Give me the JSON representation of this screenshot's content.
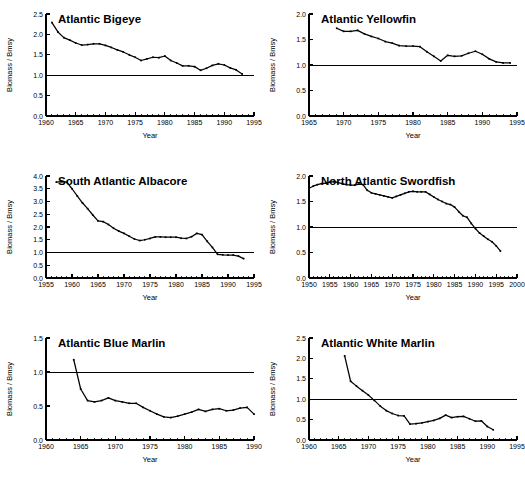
{
  "figure": {
    "shared_xlabel": "Year",
    "shared_ylabel": "Biomass / Bmsy",
    "line_color": "#000000",
    "reference_line_value": 1.0
  },
  "chart_data": [
    {
      "type": "line",
      "title": "Atlantic Bigeye",
      "xlabel": "Year",
      "ylabel": "Biomass / Bmsy",
      "xlim": [
        1960,
        1995
      ],
      "ylim": [
        0.0,
        2.5
      ],
      "xticks": [
        1960,
        1965,
        1970,
        1975,
        1980,
        1985,
        1990,
        1995
      ],
      "yticks": [
        0.0,
        0.5,
        1.0,
        1.5,
        2.0,
        2.5
      ],
      "xtick_labels": [
        "1960",
        "1965",
        "1970",
        "1975",
        "1980",
        "1985",
        "1990",
        "1995"
      ],
      "ytick_labels": [
        "0.0",
        "0.5",
        "1.0",
        "1.5",
        "2.0",
        "2.5"
      ],
      "minor_tick_step": 1,
      "grid": false,
      "reference_line": 1.0,
      "x": [
        1961,
        1962,
        1963,
        1964,
        1965,
        1966,
        1967,
        1968,
        1969,
        1970,
        1971,
        1972,
        1973,
        1974,
        1975,
        1976,
        1977,
        1978,
        1979,
        1980,
        1981,
        1982,
        1983,
        1984,
        1985,
        1986,
        1987,
        1988,
        1989,
        1990,
        1991,
        1992,
        1993
      ],
      "values": [
        2.29,
        2.06,
        1.92,
        1.86,
        1.79,
        1.74,
        1.75,
        1.77,
        1.77,
        1.73,
        1.68,
        1.62,
        1.57,
        1.5,
        1.44,
        1.36,
        1.4,
        1.44,
        1.43,
        1.47,
        1.36,
        1.3,
        1.23,
        1.23,
        1.21,
        1.12,
        1.17,
        1.24,
        1.28,
        1.25,
        1.18,
        1.13,
        1.03
      ]
    },
    {
      "type": "line",
      "title": "Atlantic Yellowfin",
      "xlabel": "Year",
      "ylabel": "Biomass / Bmsy",
      "xlim": [
        1965,
        1995
      ],
      "ylim": [
        0.0,
        2.0
      ],
      "xticks": [
        1965,
        1970,
        1975,
        1980,
        1985,
        1990,
        1995
      ],
      "yticks": [
        0.0,
        0.5,
        1.0,
        1.5,
        2.0
      ],
      "xtick_labels": [
        "1965",
        "1970",
        "1975",
        "1980",
        "1985",
        "1990",
        "1995"
      ],
      "ytick_labels": [
        "0.0",
        "0.5",
        "1.0",
        "1.5",
        "2.0"
      ],
      "minor_tick_step": 1,
      "grid": false,
      "reference_line": 1.0,
      "x": [
        1969,
        1970,
        1971,
        1972,
        1973,
        1974,
        1975,
        1976,
        1977,
        1978,
        1979,
        1980,
        1981,
        1982,
        1983,
        1984,
        1985,
        1986,
        1987,
        1988,
        1989,
        1990,
        1991,
        1992,
        1993,
        1994
      ],
      "values": [
        1.72,
        1.66,
        1.66,
        1.68,
        1.61,
        1.56,
        1.52,
        1.46,
        1.43,
        1.38,
        1.37,
        1.37,
        1.36,
        1.26,
        1.17,
        1.08,
        1.19,
        1.17,
        1.18,
        1.23,
        1.27,
        1.21,
        1.12,
        1.06,
        1.04,
        1.04
      ]
    },
    {
      "type": "line",
      "title": "South Atlantic Albacore",
      "xlabel": "Year",
      "ylabel": "Biomass / Bmsy",
      "xlim": [
        1955,
        1995
      ],
      "ylim": [
        0.0,
        4.0
      ],
      "xticks": [
        1955,
        1960,
        1965,
        1970,
        1975,
        1980,
        1985,
        1990,
        1995
      ],
      "yticks": [
        0.0,
        0.5,
        1.0,
        1.5,
        2.0,
        2.5,
        3.0,
        3.5,
        4.0
      ],
      "xtick_labels": [
        "1955",
        "1960",
        "1965",
        "1970",
        "1975",
        "1980",
        "1985",
        "1990",
        "1995"
      ],
      "ytick_labels": [
        "0.0",
        "0.5",
        "1.0",
        "1.5",
        "2.0",
        "2.5",
        "3.0",
        "3.5",
        "4.0"
      ],
      "minor_tick_step": 1,
      "grid": false,
      "reference_line": 1.0,
      "x": [
        1957,
        1958,
        1959,
        1960,
        1961,
        1962,
        1963,
        1964,
        1965,
        1966,
        1967,
        1968,
        1969,
        1970,
        1971,
        1972,
        1973,
        1974,
        1975,
        1976,
        1977,
        1978,
        1979,
        1980,
        1981,
        1982,
        1983,
        1984,
        1985,
        1986,
        1987,
        1988,
        1989,
        1990,
        1991,
        1992,
        1993
      ],
      "values": [
        3.76,
        3.78,
        3.76,
        3.5,
        3.22,
        2.95,
        2.72,
        2.47,
        2.24,
        2.21,
        2.1,
        1.95,
        1.84,
        1.75,
        1.64,
        1.53,
        1.47,
        1.5,
        1.55,
        1.61,
        1.61,
        1.6,
        1.6,
        1.6,
        1.56,
        1.55,
        1.62,
        1.75,
        1.7,
        1.44,
        1.2,
        0.93,
        0.91,
        0.9,
        0.9,
        0.86,
        0.76
      ]
    },
    {
      "type": "line",
      "title": "North Atlantic Swordfish",
      "xlabel": "Year",
      "ylabel": "Biomass / Bmsy",
      "xlim": [
        1950,
        2000
      ],
      "ylim": [
        0.0,
        2.0
      ],
      "xticks": [
        1950,
        1955,
        1960,
        1965,
        1970,
        1975,
        1980,
        1985,
        1990,
        1995,
        2000
      ],
      "yticks": [
        0.0,
        0.5,
        1.0,
        1.5,
        2.0
      ],
      "xtick_labels": [
        "1950",
        "1955",
        "1960",
        "1965",
        "1970",
        "1975",
        "1980",
        "1985",
        "1990",
        "1995",
        "2000"
      ],
      "ytick_labels": [
        "0.0",
        "0.5",
        "1.0",
        "1.5",
        "2.0"
      ],
      "minor_tick_step": 1,
      "grid": false,
      "reference_line": 1.0,
      "x": [
        1950,
        1951,
        1952,
        1953,
        1954,
        1955,
        1956,
        1957,
        1958,
        1959,
        1960,
        1961,
        1962,
        1963,
        1964,
        1965,
        1966,
        1967,
        1968,
        1969,
        1970,
        1971,
        1972,
        1973,
        1974,
        1975,
        1976,
        1977,
        1978,
        1979,
        1980,
        1981,
        1982,
        1983,
        1984,
        1985,
        1986,
        1987,
        1988,
        1989,
        1990,
        1991,
        1992,
        1993,
        1994,
        1995,
        1996
      ],
      "values": [
        1.76,
        1.8,
        1.83,
        1.85,
        1.86,
        1.88,
        1.89,
        1.87,
        1.85,
        1.83,
        1.82,
        1.82,
        1.84,
        1.83,
        1.72,
        1.67,
        1.65,
        1.63,
        1.61,
        1.59,
        1.57,
        1.6,
        1.63,
        1.66,
        1.69,
        1.7,
        1.69,
        1.69,
        1.69,
        1.64,
        1.59,
        1.54,
        1.5,
        1.46,
        1.44,
        1.39,
        1.3,
        1.22,
        1.19,
        1.07,
        0.97,
        0.88,
        0.82,
        0.76,
        0.71,
        0.63,
        0.53
      ]
    },
    {
      "type": "line",
      "title": "Atlantic Blue Marlin",
      "xlabel": "Year",
      "ylabel": "Biomass / Bmsy",
      "xlim": [
        1960,
        1990
      ],
      "ylim": [
        0.0,
        1.5
      ],
      "xticks": [
        1960,
        1965,
        1970,
        1975,
        1980,
        1985,
        1990
      ],
      "yticks": [
        0.0,
        0.5,
        1.0,
        1.5
      ],
      "xtick_labels": [
        "1960",
        "1965",
        "1970",
        "1975",
        "1980",
        "1985",
        "1990"
      ],
      "ytick_labels": [
        "0.0",
        "0.5",
        "1.0",
        "1.5"
      ],
      "minor_tick_step": 1,
      "grid": false,
      "reference_line": 1.0,
      "x": [
        1964,
        1965,
        1966,
        1967,
        1968,
        1969,
        1970,
        1971,
        1972,
        1973,
        1974,
        1975,
        1976,
        1977,
        1978,
        1979,
        1980,
        1981,
        1982,
        1983,
        1984,
        1985,
        1986,
        1987,
        1988,
        1989,
        1990
      ],
      "values": [
        1.18,
        0.75,
        0.58,
        0.56,
        0.58,
        0.62,
        0.58,
        0.56,
        0.54,
        0.54,
        0.48,
        0.43,
        0.38,
        0.34,
        0.33,
        0.35,
        0.38,
        0.41,
        0.45,
        0.42,
        0.45,
        0.46,
        0.43,
        0.44,
        0.47,
        0.48,
        0.38
      ]
    },
    {
      "type": "line",
      "title": "Atlantic White Marlin",
      "xlabel": "Year",
      "ylabel": "Biomass / Bmsy",
      "xlim": [
        1960,
        1995
      ],
      "ylim": [
        0.0,
        2.5
      ],
      "xticks": [
        1960,
        1965,
        1970,
        1975,
        1980,
        1985,
        1990,
        1995
      ],
      "yticks": [
        0.0,
        0.5,
        1.0,
        1.5,
        2.0,
        2.5
      ],
      "xtick_labels": [
        "1960",
        "1965",
        "1970",
        "1975",
        "1980",
        "1985",
        "1990",
        "1995"
      ],
      "ytick_labels": [
        "0.0",
        "0.5",
        "1.0",
        "1.5",
        "2.0",
        "2.5"
      ],
      "minor_tick_step": 1,
      "grid": false,
      "reference_line": 1.0,
      "x": [
        1966,
        1967,
        1968,
        1969,
        1970,
        1971,
        1972,
        1973,
        1974,
        1975,
        1976,
        1977,
        1978,
        1979,
        1980,
        1981,
        1982,
        1983,
        1984,
        1985,
        1986,
        1987,
        1988,
        1989,
        1990,
        1991
      ],
      "values": [
        2.06,
        1.44,
        1.32,
        1.21,
        1.1,
        0.97,
        0.83,
        0.72,
        0.65,
        0.6,
        0.59,
        0.39,
        0.4,
        0.42,
        0.45,
        0.48,
        0.53,
        0.61,
        0.55,
        0.57,
        0.58,
        0.52,
        0.46,
        0.47,
        0.33,
        0.25
      ]
    }
  ]
}
